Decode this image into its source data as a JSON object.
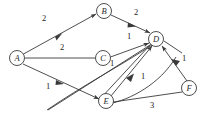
{
  "diagram": {
    "type": "directed-weighted-graph",
    "title": "",
    "nodes": [
      {
        "id": "A",
        "label": "A",
        "x": 17,
        "y": 58
      },
      {
        "id": "B",
        "label": "B",
        "x": 104,
        "y": 11
      },
      {
        "id": "C",
        "label": "C",
        "x": 103,
        "y": 58
      },
      {
        "id": "D",
        "label": "D",
        "x": 156,
        "y": 39
      },
      {
        "id": "E",
        "label": "E",
        "x": 106,
        "y": 101
      },
      {
        "id": "F",
        "label": "F",
        "x": 189,
        "y": 88
      }
    ],
    "node_radius": 7.5,
    "edges": [
      {
        "from": "A",
        "to": "B",
        "weight": "2",
        "label_x": 44,
        "label_y": 18
      },
      {
        "from": "B",
        "to": "D",
        "weight": "2",
        "label_x": 136,
        "label_y": 12
      },
      {
        "from": "A",
        "to": "C",
        "weight": "2",
        "label_x": 62,
        "label_y": 47
      },
      {
        "from": "C",
        "to": "D",
        "weight": "1",
        "label_x": 129,
        "label_y": 36
      },
      {
        "from": "A",
        "to": "E",
        "weight": "1",
        "label_x": 48,
        "label_y": 86
      },
      {
        "from": "E",
        "to": "D",
        "weight": "1",
        "label_x": 143,
        "label_y": 76
      },
      {
        "from": "E",
        "to": "F",
        "weight": "3",
        "label_x": 152,
        "label_y": 105
      },
      {
        "from": "F",
        "to": "D",
        "weight": "1",
        "label_x": 184,
        "label_y": 58
      },
      {
        "from": "C",
        "to": "E",
        "weight": "1",
        "label_x": 112,
        "label_y": 63
      }
    ],
    "colors": {
      "stroke": "#3a3a3a",
      "text": "#222222",
      "background": "#ffffff"
    }
  }
}
